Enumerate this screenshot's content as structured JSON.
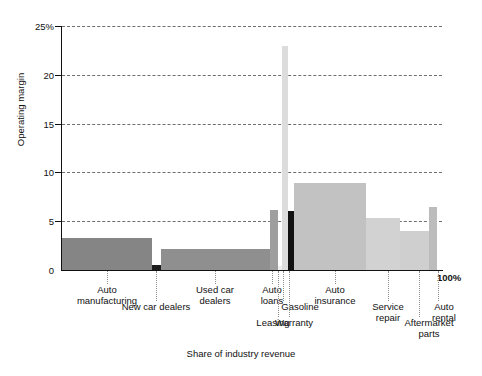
{
  "chart_data": {
    "type": "bar",
    "title": "",
    "subtitle": "",
    "xlabel": "Share of industry revenue",
    "ylabel": "Operating margin",
    "ylim": [
      0,
      25
    ],
    "xlim": [
      0,
      100
    ],
    "grid": true,
    "legend": "none",
    "y_ticks": [
      "0",
      "5",
      "10",
      "15",
      "20",
      "25%"
    ],
    "y_tick_values": [
      0,
      5,
      10,
      15,
      20,
      25
    ],
    "x_ticks": [
      "100%"
    ],
    "x_tick_values": [
      100
    ],
    "categories": [
      "Auto manufacturing",
      "New car dealers",
      "Used car dealers",
      "Auto loans",
      "Leasing",
      "Gasoline",
      "Warranty",
      "Auto insurance",
      "Service repair",
      "Aftermarket parts",
      "Auto rental"
    ],
    "values": [
      3.3,
      0.5,
      2.2,
      6.1,
      0.4,
      23.0,
      6.0,
      8.9,
      5.3,
      4.0,
      6.5
    ],
    "widths": [
      23.7,
      2.4,
      28.7,
      2.1,
      1.1,
      1.6,
      1.4,
      18.9,
      9.0,
      7.6,
      2.1
    ],
    "x_start": [
      0.0,
      23.7,
      26.1,
      54.8,
      56.9,
      58.0,
      59.6,
      61.0,
      79.9,
      88.9,
      96.5
    ],
    "bar_colors": [
      "#858585",
      "#1c1c1c",
      "#8f8f8f",
      "#9e9e9e",
      "#efefef",
      "#dcdcdc",
      "#111111",
      "#c2c2c2",
      "#d2d2d2",
      "#cfcfcf",
      "#bcbcbc"
    ]
  },
  "axes": {
    "y_title": "Operating margin",
    "x_title": "Share of industry revenue",
    "x_max_label": "100%"
  },
  "labels": {
    "auto_manufacturing": "Auto\nmanufacturing",
    "new_car_dealers": "New car dealers",
    "used_car_dealers": "Used car\ndealers",
    "auto_loans": "Auto\nloans",
    "leasing": "Leasing",
    "gasoline": "Gasoline",
    "warranty": "Warranty",
    "auto_insurance": "Auto\ninsurance",
    "service_repair": "Service\nrepair",
    "aftermarket_parts": "Aftermarket\nparts",
    "auto_rental": "Auto\nrental"
  },
  "y_tick_labels": {
    "t0": "0",
    "t5": "5",
    "t10": "10",
    "t15": "15",
    "t20": "20",
    "t25": "25%"
  }
}
